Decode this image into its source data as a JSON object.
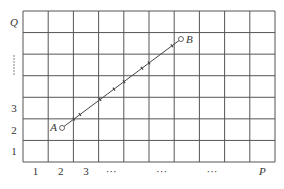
{
  "diagram": {
    "grid": {
      "columns": 10,
      "rows": 7,
      "line_color": "#555555"
    },
    "y_axis": {
      "title": "Q",
      "labels": [
        {
          "row": 1,
          "text": "1"
        },
        {
          "row": 2,
          "text": "2"
        },
        {
          "row": 3,
          "text": "3"
        },
        {
          "row": 5,
          "text": "⋮",
          "vertical_dots": true
        },
        {
          "row": 7,
          "text": "Q"
        }
      ]
    },
    "x_axis": {
      "title": "P",
      "labels": [
        {
          "col": 1,
          "text": "1"
        },
        {
          "col": 2,
          "text": "2"
        },
        {
          "col": 3,
          "text": "3"
        },
        {
          "col": 4,
          "text": "···"
        },
        {
          "col": 6,
          "text": "···"
        },
        {
          "col": 8,
          "text": "···"
        },
        {
          "col": 10,
          "text": "P"
        }
      ]
    },
    "segment": {
      "start": {
        "label": "A",
        "x": 1.55,
        "y": 1.58
      },
      "end": {
        "label": "B",
        "x": 6.27,
        "y": 5.7
      },
      "tick_marks_x": [
        2.02,
        2.26,
        3.06,
        3.61,
        4.01,
        4.72,
        5.0,
        5.91
      ],
      "color": "#444444"
    }
  }
}
